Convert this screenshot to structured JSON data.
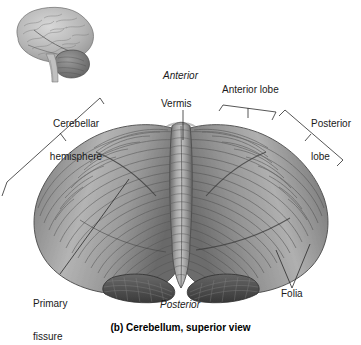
{
  "figure": {
    "caption": "(b) Cerebellum, superior view",
    "caption_prefix": "(b)",
    "subject": "cerebellum",
    "view": "superior"
  },
  "inset": {
    "name": "brain-lateral-inset",
    "description": "lateral view of whole brain with cerebellum shaded"
  },
  "orientation_labels": {
    "anterior": "Anterior",
    "posterior": "Posterior"
  },
  "labels": [
    {
      "id": "cerebellar-hemisphere",
      "line1": "Cerebellar",
      "line2": "hemisphere",
      "text": "Cerebellar hemisphere"
    },
    {
      "id": "vermis",
      "line1": "Vermis",
      "line2": "",
      "text": "Vermis"
    },
    {
      "id": "anterior-lobe",
      "line1": "Anterior lobe",
      "line2": "",
      "text": "Anterior lobe"
    },
    {
      "id": "posterior-lobe",
      "line1": "Posterior",
      "line2": "lobe",
      "text": "Posterior lobe"
    },
    {
      "id": "primary-fissure",
      "line1": "Primary",
      "line2": "fissure",
      "text": "Primary fissure"
    },
    {
      "id": "folia",
      "line1": "Folia",
      "line2": "",
      "text": "Folia"
    }
  ],
  "colors": {
    "background": "#ffffff",
    "text": "#1a1a1a",
    "leader_line": "#2b2b2b",
    "tissue_light": "#d2d2d2",
    "tissue_mid": "#9a9a9a",
    "tissue_dark": "#5f5f5f",
    "tissue_deep": "#3a3a3a",
    "inset_brain": "#b9b9b9",
    "inset_cerebellum": "#7c7c7c"
  }
}
